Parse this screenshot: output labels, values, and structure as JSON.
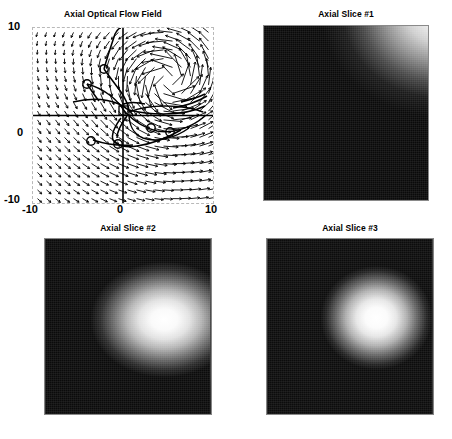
{
  "figure": {
    "background_color": "#ffffff",
    "layout": "2x2 subplot grid"
  },
  "chart_data": [
    {
      "type": "scatter",
      "subplot": "top-left",
      "title": "Axial Optical Flow Field",
      "xlabel": "",
      "ylabel": "",
      "xlim": [
        -10,
        10
      ],
      "ylim": [
        -10,
        10
      ],
      "xticks": [
        -10,
        0,
        10
      ],
      "yticks": [
        -10,
        0,
        10
      ],
      "xticklabels": [
        "-10",
        "0",
        "10"
      ],
      "yticklabels": [
        "-10",
        "0",
        "10"
      ],
      "grid": false,
      "frame": "dashed-gray-box",
      "legend": "none",
      "description": "Quiver vector field with overlaid streamline trajectories and circular seed-point markers",
      "marker_color": "#000000",
      "arrow_color": "#000000",
      "seed_markers": [
        {
          "x": -2.1,
          "y": 5.2
        },
        {
          "x": -4.0,
          "y": 3.6
        },
        {
          "x": -3.5,
          "y": -2.6
        },
        {
          "x": -0.6,
          "y": -2.9
        },
        {
          "x": 3.1,
          "y": -1.4
        },
        {
          "x": 5.2,
          "y": -1.9
        }
      ],
      "quiver": {
        "grid_nx": 20,
        "grid_ny": 20,
        "note": "Vectors point up-right in upper-left quadrant, circulate around a vortex at roughly (5, 4), and point right with small magnitude along the lower-left region"
      }
    },
    {
      "type": "heatmap",
      "subplot": "top-right",
      "title": "Axial Slice #1",
      "colormap": "gray",
      "axes_visible": false,
      "description": "Dark axial grayscale slice with a bright lobe entering from the upper-right corner and a faint mid-gray oval near the center",
      "bright_regions": [
        {
          "cx": 0.88,
          "cy": 0.1,
          "intensity": 1.0
        },
        {
          "cx": 0.52,
          "cy": 0.47,
          "intensity": 0.34
        }
      ]
    },
    {
      "type": "heatmap",
      "subplot": "bottom-left",
      "title": "Axial Slice #2",
      "colormap": "gray",
      "axes_visible": false,
      "description": "Axial grayscale slice with a large bright mass occupying the right half and dark tissue on the left",
      "bright_regions": [
        {
          "cx": 0.72,
          "cy": 0.46,
          "intensity": 1.0
        },
        {
          "cx": 0.93,
          "cy": 0.18,
          "intensity": 0.88
        }
      ]
    },
    {
      "type": "heatmap",
      "subplot": "bottom-right",
      "title": "Axial Slice #3",
      "colormap": "gray",
      "axes_visible": false,
      "description": "Axial grayscale slice with a bright rounded mass right of center, a mid-gray band across the top and dark tissue at lower-left",
      "bright_regions": [
        {
          "cx": 0.66,
          "cy": 0.45,
          "intensity": 1.0
        },
        {
          "cx": 0.8,
          "cy": 0.1,
          "intensity": 0.55
        }
      ]
    }
  ],
  "quiver_panel": {
    "title": "Axial Optical Flow Field",
    "y_top": "10",
    "y_mid": "0",
    "y_bottom": "-10",
    "x_left": "-10",
    "x_mid": "0",
    "x_right": "10"
  },
  "slice1": {
    "title": "Axial Slice #1"
  },
  "slice2": {
    "title": "Axial Slice #2"
  },
  "slice3": {
    "title": "Axial Slice #3"
  }
}
